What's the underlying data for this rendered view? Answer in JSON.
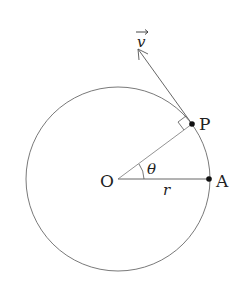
{
  "diagram": {
    "title": "",
    "center_label": "O",
    "point_p_label": "P",
    "point_a_label": "A",
    "radius_label": "r",
    "angle_label": "θ",
    "velocity_label": "v",
    "colors": {
      "stroke": "#555555",
      "dot": "#111111",
      "text": "#222222"
    }
  }
}
